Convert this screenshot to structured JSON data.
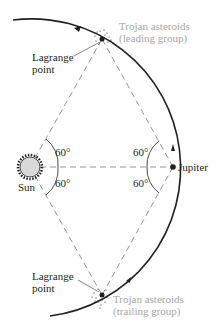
{
  "diagram": {
    "labels": {
      "leading_group_line1": "Trojan asteroids",
      "leading_group_line2": "(leading group)",
      "trailing_group_line1": "Trojan asteroids",
      "trailing_group_line2": "(trailing group)",
      "lagrange_top_line1": "Lagrange",
      "lagrange_top_line2": "point",
      "lagrange_bottom_line1": "Lagrange",
      "lagrange_bottom_line2": "point",
      "sun": "Sun",
      "jupiter": "Jupiter"
    },
    "angles": {
      "sun_upper": "60°",
      "sun_lower": "60°",
      "jupiter_upper": "60°",
      "jupiter_lower": "60°"
    },
    "colors": {
      "ink": "#231f20",
      "asteroid_label": "#a8a8a8",
      "sun_fill": "#d9d9d9"
    }
  }
}
